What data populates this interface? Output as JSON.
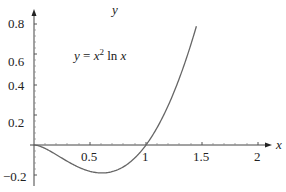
{
  "chart_data": {
    "type": "line",
    "title": "",
    "annotation": "y = x^2 ln x",
    "xlabel": "x",
    "ylabel": "y",
    "xlim": [
      0,
      2.1
    ],
    "ylim": [
      -0.2,
      0.85
    ],
    "x_ticks": [
      "0.5",
      "1",
      "1.5",
      "2"
    ],
    "y_ticks": [
      "-0.2",
      "0.2",
      "0.4",
      "0.6",
      "0.8"
    ],
    "grid": false,
    "series": [
      {
        "name": "y = x^2 ln x",
        "x": [
          0.0,
          0.1,
          0.2,
          0.3,
          0.4,
          0.5,
          0.607,
          0.7,
          0.8,
          0.9,
          1.0,
          1.1,
          1.2,
          1.3,
          1.4,
          1.45
        ],
        "y": [
          0.0,
          -0.023,
          -0.064,
          -0.108,
          -0.147,
          -0.173,
          -0.184,
          -0.175,
          -0.143,
          -0.085,
          0.0,
          0.115,
          0.263,
          0.443,
          0.659,
          0.781
        ]
      }
    ],
    "color": "#666666"
  },
  "labels": {
    "y_axis": "y",
    "x_axis": "x",
    "eq_y": "y",
    "eq_eq": " = ",
    "eq_x": "x",
    "eq_exp": "2",
    "eq_ln": " ln ",
    "eq_x2": "x",
    "y_08": "0.8",
    "y_06": "0.6",
    "y_04": "0.4",
    "y_02": "0.2",
    "y_m02": "−0.2",
    "x_05": "0.5",
    "x_1": "1",
    "x_15": "1.5",
    "x_2": "2"
  }
}
